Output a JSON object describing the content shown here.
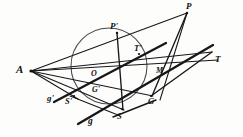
{
  "figure": {
    "width": 243,
    "height": 137,
    "background_color": "#fdfdfb",
    "ink_color": "#17171a",
    "circle_color": "#4a4a4e"
  },
  "labels": [
    {
      "id": "A",
      "text": "A",
      "x": 16,
      "y": 64,
      "size": 11
    },
    {
      "id": "Pprime",
      "text": "P'",
      "x": 110,
      "y": 22,
      "size": 9
    },
    {
      "id": "P",
      "text": "P",
      "x": 186,
      "y": 2,
      "size": 9
    },
    {
      "id": "Tprime",
      "text": "T'",
      "x": 134,
      "y": 44,
      "size": 8.5
    },
    {
      "id": "T",
      "text": "T",
      "x": 215,
      "y": 55,
      "size": 9
    },
    {
      "id": "M",
      "text": "M",
      "x": 156,
      "y": 67,
      "size": 8
    },
    {
      "id": "O",
      "text": "O",
      "x": 91,
      "y": 70,
      "size": 8
    },
    {
      "id": "Gprime",
      "text": "G'",
      "x": 92,
      "y": 86,
      "size": 8
    },
    {
      "id": "G",
      "text": "G",
      "x": 148,
      "y": 97,
      "size": 8.5
    },
    {
      "id": "gprime",
      "text": "g'",
      "x": 47,
      "y": 94,
      "size": 9
    },
    {
      "id": "Sprime",
      "text": "S'",
      "x": 65,
      "y": 97,
      "size": 8.5
    },
    {
      "id": "g",
      "text": "g",
      "x": 88,
      "y": 117,
      "size": 9.5
    },
    {
      "id": "S",
      "text": "S",
      "x": 117,
      "y": 112,
      "size": 8.5
    }
  ],
  "points": {
    "A": {
      "x": 31,
      "y": 71
    },
    "Pprime": {
      "x": 117,
      "y": 33
    },
    "P": {
      "x": 187,
      "y": 13
    },
    "Tprime": {
      "x": 139,
      "y": 54
    },
    "T": {
      "x": 211,
      "y": 53
    },
    "M": {
      "x": 159,
      "y": 78
    },
    "O": {
      "x": 98,
      "y": 79
    },
    "Gprime": {
      "x": 98,
      "y": 81
    },
    "G": {
      "x": 151,
      "y": 95
    },
    "Sprime": {
      "x": 74,
      "y": 96
    },
    "S": {
      "x": 122,
      "y": 109
    }
  },
  "circle": {
    "name": "conic-circle",
    "cx": 109,
    "cy": 66,
    "r": 38
  },
  "lines": [
    {
      "name": "line-A-to-P",
      "x1": 31,
      "y1": 71,
      "x2": 187,
      "y2": 13,
      "weight": "thin"
    },
    {
      "name": "line-A-to-T",
      "x1": 31,
      "y1": 71,
      "x2": 212,
      "y2": 52,
      "weight": "thin"
    },
    {
      "name": "line-A-to-Tprime",
      "x1": 31,
      "y1": 71,
      "x2": 218,
      "y2": 60,
      "weight": "thin"
    },
    {
      "name": "line-A-to-G",
      "x1": 31,
      "y1": 71,
      "x2": 153,
      "y2": 96,
      "weight": "thin"
    },
    {
      "name": "line-A-to-S",
      "x1": 31,
      "y1": 71,
      "x2": 124,
      "y2": 110,
      "weight": "thin"
    },
    {
      "name": "line-A-to-Sprime",
      "x1": 31,
      "y1": 71,
      "x2": 78,
      "y2": 99,
      "weight": "thin"
    },
    {
      "name": "line-P-to-G",
      "x1": 187,
      "y1": 13,
      "x2": 152,
      "y2": 96,
      "weight": "medium"
    },
    {
      "name": "line-Pprime-to-S",
      "x1": 117,
      "y1": 33,
      "x2": 123,
      "y2": 110,
      "weight": "medium"
    },
    {
      "name": "line-g-secant",
      "x1": 78,
      "y1": 124,
      "x2": 213,
      "y2": 45,
      "weight": "thick"
    },
    {
      "name": "line-gprime-secant",
      "x1": 54,
      "y1": 102,
      "x2": 166,
      "y2": 43,
      "weight": "thick"
    },
    {
      "name": "line-P-M-chord",
      "x1": 187,
      "y1": 13,
      "x2": 160,
      "y2": 100,
      "weight": "thin"
    },
    {
      "name": "line-G-to-T",
      "x1": 151,
      "y1": 96,
      "x2": 212,
      "y2": 52,
      "weight": "medium"
    },
    {
      "name": "line-S-to-G",
      "x1": 113,
      "y1": 117,
      "x2": 156,
      "y2": 100,
      "weight": "medium"
    },
    {
      "name": "line-Sprime-base",
      "x1": 70,
      "y1": 96,
      "x2": 118,
      "y2": 115,
      "weight": "thin"
    }
  ]
}
